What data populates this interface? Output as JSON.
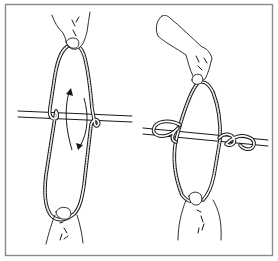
{
  "illustration": {
    "description": "Two-panel line drawing showing a rope loop held by two hands being twisted around a horizontal bar, then tied off with knots on the bar",
    "colors": {
      "background": "#ffffff",
      "ink": "#1a1a1a",
      "frame": "#8a8a8a"
    },
    "panels": [
      {
        "id": "left",
        "step": "twist",
        "elements": [
          "top-hand",
          "rope-loop",
          "horizontal-bar",
          "rotation-arrows",
          "bottom-hand"
        ]
      },
      {
        "id": "right",
        "step": "tied",
        "elements": [
          "top-hand",
          "rope-loop",
          "horizontal-bar",
          "left-knot",
          "right-knot",
          "bottom-hand"
        ]
      }
    ]
  }
}
